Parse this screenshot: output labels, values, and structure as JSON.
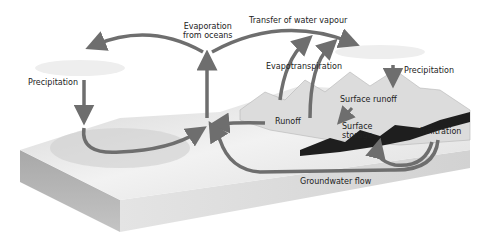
{
  "diagram": {
    "labels": {
      "evaporation_oceans_line1": "Evaporation",
      "evaporation_oceans_line2": "from oceans",
      "transfer_vapour": "Transfer of water vapour",
      "precipitation_left": "Precipitation",
      "evapotranspiration": "Evapotranspiration",
      "precipitation_right": "Precipitation",
      "surface_runoff": "Surface runoff",
      "runoff": "Runoff",
      "surface_storage_line1": "Surface",
      "surface_storage_line2": "storage",
      "infiltration": "Infiltration",
      "groundwater_flow": "Groundwater flow"
    },
    "colors": {
      "arrow": "#6e6e6e",
      "block_top": "#e6e6e6",
      "block_side": "#b9b9b9",
      "block_front": "#d6d6d6",
      "mountain_dark": "#1e1e1e",
      "text": "#222222"
    }
  }
}
